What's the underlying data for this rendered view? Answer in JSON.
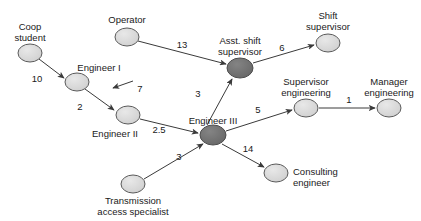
{
  "diagram": {
    "type": "directed-graph",
    "background_color": "#ffffff",
    "node_fill_light": "#d6d6d6",
    "node_fill_dark": "#6f6f6f",
    "node_stroke": "#5a5a5a",
    "edge_color": "#3a3a3a",
    "text_color": "#1a1a1a",
    "nodes": [
      {
        "id": "coop-student",
        "label": "Coop\nstudent",
        "cx": 30,
        "cy": 53,
        "rx": 12,
        "ry": 9,
        "shade": "light",
        "label_x": 30,
        "label_y": 21,
        "align": "center"
      },
      {
        "id": "operator",
        "label": "Operator",
        "cx": 127,
        "cy": 37,
        "rx": 12,
        "ry": 9,
        "shade": "light",
        "label_x": 127,
        "label_y": 14,
        "align": "center"
      },
      {
        "id": "engineer-i",
        "label": "Engineer I",
        "cx": 77,
        "cy": 82,
        "rx": 12,
        "ry": 9,
        "shade": "light",
        "label_x": 99,
        "label_y": 62,
        "align": "center"
      },
      {
        "id": "engineer-ii",
        "label": "Engineer II",
        "cx": 128,
        "cy": 115,
        "rx": 12,
        "ry": 9,
        "shade": "light",
        "label_x": 115,
        "label_y": 128,
        "align": "center"
      },
      {
        "id": "engineer-iii",
        "label": "Engineer III",
        "cx": 213,
        "cy": 135,
        "rx": 13,
        "ry": 10,
        "shade": "dark",
        "label_x": 213,
        "label_y": 115,
        "align": "center"
      },
      {
        "id": "asst-shift-supervisor",
        "label": "Asst. shift\nsupervisor",
        "cx": 240,
        "cy": 68,
        "rx": 13,
        "ry": 10,
        "shade": "dark",
        "label_x": 240,
        "label_y": 35,
        "align": "center"
      },
      {
        "id": "shift-supervisor",
        "label": "Shift\nsupervisor",
        "cx": 328,
        "cy": 43,
        "rx": 12,
        "ry": 9,
        "shade": "light",
        "label_x": 328,
        "label_y": 10,
        "align": "center"
      },
      {
        "id": "supervisor-engineering",
        "label": "Supervisor\nengineering",
        "cx": 306,
        "cy": 108,
        "rx": 12,
        "ry": 9,
        "shade": "light",
        "label_x": 306,
        "label_y": 76,
        "align": "center"
      },
      {
        "id": "manager-engineering",
        "label": "Manager\nengineering",
        "cx": 389,
        "cy": 108,
        "rx": 12,
        "ry": 9,
        "shade": "light",
        "label_x": 389,
        "label_y": 76,
        "align": "center"
      },
      {
        "id": "consulting-engineer",
        "label": "Consulting\nengineer",
        "cx": 276,
        "cy": 173,
        "rx": 12,
        "ry": 9,
        "shade": "light",
        "label_x": 293,
        "label_y": 166,
        "align": "left"
      },
      {
        "id": "transmission-access-specialist",
        "label": "Transmission\naccess specialist",
        "cx": 133,
        "cy": 184,
        "rx": 12,
        "ry": 9,
        "shade": "light",
        "label_x": 133,
        "label_y": 195,
        "align": "center"
      }
    ],
    "edges": [
      {
        "id": "coop-to-eng1",
        "from": "coop-student",
        "to": "engineer-i",
        "weight": "10",
        "label_x": 37,
        "label_y": 78
      },
      {
        "id": "operator-to-asst",
        "from": "operator",
        "to": "asst-shift-supervisor",
        "weight": "13",
        "label_x": 182,
        "label_y": 44
      },
      {
        "id": "eng1-to-eng2",
        "from": "engineer-i",
        "to": "engineer-ii",
        "weight": "2",
        "label_x": 80,
        "label_y": 106
      },
      {
        "id": "eng3-to-eng1",
        "from": "engineer-iii",
        "to": "engineer-i",
        "weight": "7",
        "label_x": 140,
        "label_y": 88
      },
      {
        "id": "eng2-to-eng3",
        "from": "engineer-ii",
        "to": "engineer-iii",
        "weight": "2.5",
        "label_x": 159,
        "label_y": 129
      },
      {
        "id": "eng3-to-asst",
        "from": "engineer-iii",
        "to": "asst-shift-supervisor",
        "weight": "3",
        "label_x": 198,
        "label_y": 93
      },
      {
        "id": "asst-to-shift",
        "from": "asst-shift-supervisor",
        "to": "shift-supervisor",
        "weight": "6",
        "label_x": 282,
        "label_y": 47
      },
      {
        "id": "eng3-to-supeng",
        "from": "engineer-iii",
        "to": "supervisor-engineering",
        "weight": "5",
        "label_x": 258,
        "label_y": 109
      },
      {
        "id": "supeng-to-mgreng",
        "from": "supervisor-engineering",
        "to": "manager-engineering",
        "weight": "1",
        "label_x": 349,
        "label_y": 99
      },
      {
        "id": "eng3-to-consulting",
        "from": "engineer-iii",
        "to": "consulting-engineer",
        "weight": "14",
        "label_x": 248,
        "label_y": 148
      },
      {
        "id": "tas-to-eng3",
        "from": "transmission-access-specialist",
        "to": "engineer-iii",
        "weight": "3",
        "label_x": 179,
        "label_y": 156
      }
    ]
  }
}
